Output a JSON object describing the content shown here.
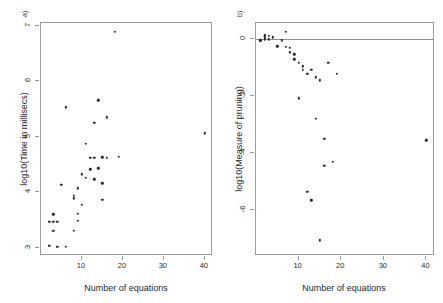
{
  "figure": {
    "width": 443,
    "height": 303,
    "background": "#ffffff",
    "point_color": "#2a2a2a",
    "axis_color": "#9a9a9a"
  },
  "chart_data": [
    {
      "type": "scatter",
      "panel_tag": "a)",
      "title": "",
      "xlabel": "Number of equations",
      "ylabel": "log10(Time in millisecs)",
      "xlim": [
        0,
        42
      ],
      "ylim": [
        2.85,
        7.05
      ],
      "xticks": [
        10,
        20,
        30,
        40
      ],
      "yticks": [
        3,
        4,
        5,
        6,
        7
      ],
      "grid": false,
      "legend": null,
      "x": [
        2,
        2,
        3,
        3,
        3,
        4,
        4,
        5,
        6,
        6,
        8,
        8,
        8,
        9,
        9,
        9,
        10,
        10,
        11,
        11,
        12,
        12,
        13,
        13,
        13,
        14,
        14,
        15,
        15,
        15,
        16,
        16,
        18,
        19,
        40
      ],
      "y": [
        3.47,
        3.03,
        3.6,
        3.47,
        3.3,
        3.47,
        3.02,
        4.13,
        5.53,
        3.02,
        3.94,
        3.89,
        3.3,
        4.07,
        3.61,
        3.48,
        3.77,
        4.32,
        4.87,
        4.26,
        4.41,
        4.62,
        5.25,
        4.62,
        4.23,
        5.66,
        4.43,
        4.63,
        4.16,
        3.86,
        5.35,
        4.62,
        6.89,
        4.64,
        5.06
      ]
    },
    {
      "type": "scatter",
      "panel_tag": "b)",
      "title": "",
      "xlabel": "Number of equations",
      "ylabel": "log10(Measure of pruning)",
      "xlim": [
        0,
        42
      ],
      "ylim": [
        -7.6,
        0.55
      ],
      "xticks": [
        10,
        20,
        30,
        40
      ],
      "yticks": [
        0,
        -2,
        -4,
        -6
      ],
      "grid": false,
      "legend": null,
      "reference_line_y": 0,
      "x": [
        1,
        1,
        2,
        2,
        2,
        2,
        3,
        3,
        4,
        5,
        6,
        7,
        7,
        8,
        8,
        9,
        9,
        10,
        10,
        11,
        11,
        12,
        12,
        13,
        13,
        14,
        14,
        15,
        15,
        16,
        16,
        17,
        18,
        19,
        40
      ],
      "y": [
        -0.05,
        -0.08,
        0.12,
        0.08,
        0.02,
        -0.04,
        0.1,
        -0.02,
        0.05,
        -0.27,
        -0.06,
        0.25,
        -0.28,
        -0.32,
        -0.48,
        -0.55,
        -0.72,
        -0.85,
        -2.08,
        -0.97,
        -1.08,
        -1.22,
        -5.35,
        -1.08,
        -5.65,
        -1.35,
        -2.8,
        -1.45,
        -7.05,
        -3.5,
        -4.45,
        -0.85,
        -4.3,
        -1.22,
        -3.55
      ]
    }
  ]
}
